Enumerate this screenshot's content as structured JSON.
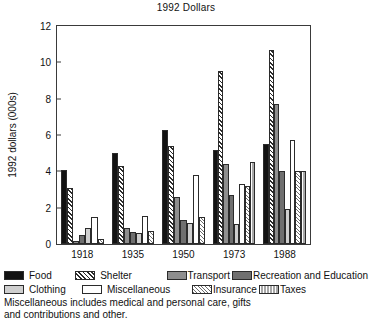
{
  "chart_data": {
    "type": "bar",
    "title": "1992 Dollars",
    "xlabel": "",
    "ylabel": "1992  dollars (000s)",
    "ylim": [
      0,
      12
    ],
    "yticks": [
      0,
      2,
      4,
      6,
      8,
      10,
      12
    ],
    "grid": false,
    "legend_position": "below",
    "categories": [
      "1918",
      "1935",
      "1950",
      "1973",
      "1988"
    ],
    "series": [
      {
        "name": "Food",
        "pattern": "solid-black",
        "values": [
          4.1,
          5.0,
          6.25,
          5.2,
          5.5
        ]
      },
      {
        "name": "Shelter",
        "pattern": "diagonal-hatch",
        "values": [
          3.1,
          4.3,
          5.4,
          9.5,
          10.7
        ]
      },
      {
        "name": "Transport",
        "pattern": "medium-grey",
        "values": [
          0.15,
          0.9,
          2.6,
          4.4,
          7.7
        ]
      },
      {
        "name": "Recreation and Education",
        "pattern": "dark-grey",
        "values": [
          0.5,
          0.65,
          1.3,
          2.7,
          4.0
        ]
      },
      {
        "name": "Clothing",
        "pattern": "light-grey",
        "values": [
          0.9,
          0.6,
          1.15,
          1.1,
          1.9
        ]
      },
      {
        "name": "Miscellaneous",
        "pattern": "white",
        "values": [
          1.5,
          1.55,
          3.8,
          3.3,
          5.7
        ]
      },
      {
        "name": "Insurance",
        "pattern": "stipple-hatch",
        "values": [
          0.3,
          0.7,
          1.5,
          3.2,
          4.0
        ]
      },
      {
        "name": "Taxes",
        "pattern": "vertical-lines",
        "values": [
          null,
          null,
          null,
          4.5,
          4.0
        ]
      }
    ]
  },
  "chart": {
    "title": "1992 Dollars",
    "y_axis_label": "1992  dollars (000s)",
    "y_tick_labels": [
      "0",
      "2",
      "4",
      "6",
      "8",
      "10",
      "12"
    ],
    "x_tick_labels": [
      "1918",
      "1935",
      "1950",
      "1973",
      "1988"
    ]
  },
  "legend": {
    "row1": [
      {
        "label": "Food",
        "swatch": "solid-black-swatch"
      },
      {
        "label": "Shelter",
        "swatch": "diagonal-hatch-swatch"
      },
      {
        "label": "Transport",
        "swatch": "medium-grey-swatch"
      },
      {
        "label": "Recreation and Education",
        "swatch": "dark-grey-swatch"
      }
    ],
    "row2": [
      {
        "label": "Clothing",
        "swatch": "light-grey-swatch"
      },
      {
        "label": "Miscellaneous",
        "swatch": "white-swatch"
      },
      {
        "label": "Insurance",
        "swatch": "stipple-hatch-swatch"
      },
      {
        "label": "Taxes",
        "swatch": "vertical-lines-swatch"
      }
    ]
  },
  "footnote": {
    "line1": "Miscellaneous includes medical and personal care, gifts",
    "line2": "and contributions and other."
  },
  "colors": {
    "axis": "#3a3a3a",
    "text": "#111111",
    "background": "#ffffff",
    "food": "#121212",
    "transport": "#8e8e8e",
    "recreation": "#6f6f6f",
    "clothing": "#cfcfcf",
    "miscellaneous": "#ffffff",
    "insurance": "#e2e2e2",
    "taxes": "#a8a8a8"
  }
}
